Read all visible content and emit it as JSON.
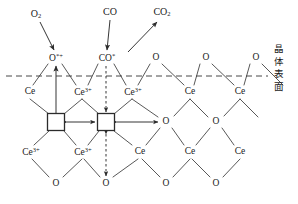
{
  "figure": {
    "kind": "reaction-mechanism-schematic",
    "surface_label": {
      "chars": [
        "晶",
        "体",
        "表",
        "面"
      ],
      "meaning": "crystal surface"
    },
    "colors": {
      "line": "#333333",
      "text": "#1a1a1a",
      "dashed": "#333333",
      "vacancy_fill": "#ffffff",
      "vacancy_stroke": "#333333"
    }
  },
  "gas_species": [
    {
      "id": "o2",
      "label_html": "O<sub>2</sub>",
      "text": "O2",
      "x": 36,
      "y": 14
    },
    {
      "id": "co",
      "label_html": "CO",
      "text": "CO",
      "x": 110,
      "y": 12
    },
    {
      "id": "co2",
      "label_html": "CO<sub>2</sub>",
      "text": "CO2",
      "x": 160,
      "y": 12
    }
  ],
  "adsorbate_row": [
    {
      "id": "o-star-plus",
      "label_html": "O<sup>*</sup><sup>+</sup>",
      "text": "O*+",
      "x": 55,
      "y": 58
    },
    {
      "id": "co-star",
      "label_html": "CO<sup>*</sup>",
      "text": "CO*",
      "x": 106,
      "y": 58
    },
    {
      "id": "o-top-1",
      "label_html": "O",
      "text": "O",
      "x": 156,
      "y": 58
    },
    {
      "id": "o-top-2",
      "label_html": "O",
      "text": "O",
      "x": 206,
      "y": 58
    },
    {
      "id": "o-top-3",
      "label_html": "O",
      "text": "O",
      "x": 256,
      "y": 58
    }
  ],
  "cation_row_upper": [
    {
      "id": "ce-u1",
      "label_html": "Ce",
      "text": "Ce",
      "x": 30,
      "y": 92
    },
    {
      "id": "ce-u2",
      "label_html": "Ce<sup>3+</sup>",
      "text": "Ce3+",
      "x": 82,
      "y": 92
    },
    {
      "id": "ce-u3",
      "label_html": "Ce<sup>3+</sup>",
      "text": "Ce3+",
      "x": 132,
      "y": 92
    },
    {
      "id": "ce-u4",
      "label_html": "Ce",
      "text": "Ce",
      "x": 190,
      "y": 92
    },
    {
      "id": "ce-u5",
      "label_html": "Ce",
      "text": "Ce",
      "x": 240,
      "y": 92
    }
  ],
  "vacancy_row": [
    {
      "id": "vacancy-1",
      "type": "square",
      "x": 56,
      "y": 122
    },
    {
      "id": "vacancy-2",
      "type": "square",
      "x": 106,
      "y": 122
    },
    {
      "id": "o-mid-1",
      "type": "label",
      "label_html": "O",
      "text": "O",
      "x": 166,
      "y": 122
    },
    {
      "id": "o-mid-2",
      "type": "label",
      "label_html": "O",
      "text": "O",
      "x": 216,
      "y": 122
    }
  ],
  "cation_row_lower": [
    {
      "id": "ce-l1",
      "label_html": "Ce<sup>3+</sup>",
      "text": "Ce3+",
      "x": 30,
      "y": 152
    },
    {
      "id": "ce-l2",
      "label_html": "Ce<sup>3+</sup>",
      "text": "Ce3+",
      "x": 82,
      "y": 152
    },
    {
      "id": "ce-l3",
      "label_html": "Ce",
      "text": "Ce",
      "x": 140,
      "y": 152
    },
    {
      "id": "ce-l4",
      "label_html": "Ce",
      "text": "Ce",
      "x": 190,
      "y": 152
    },
    {
      "id": "ce-l5",
      "label_html": "Ce",
      "text": "Ce",
      "x": 240,
      "y": 152
    }
  ],
  "anion_row_bottom": [
    {
      "id": "o-b1",
      "label_html": "O",
      "text": "O",
      "x": 56,
      "y": 184
    },
    {
      "id": "o-b2",
      "label_html": "O",
      "text": "O",
      "x": 106,
      "y": 184
    },
    {
      "id": "o-b3",
      "label_html": "O",
      "text": "O",
      "x": 166,
      "y": 184
    },
    {
      "id": "o-b4",
      "label_html": "O",
      "text": "O",
      "x": 216,
      "y": 184
    }
  ],
  "arrows": [
    {
      "id": "arrow-o2-adsorb",
      "from": "O2 gas",
      "to": "O*+ site",
      "style": "single"
    },
    {
      "id": "arrow-co-adsorb",
      "from": "CO gas",
      "to": "CO* site",
      "style": "single"
    },
    {
      "id": "arrow-co2-desorb",
      "from": "surface",
      "to": "CO2 gas",
      "style": "single"
    },
    {
      "id": "arrow-vac-to-o",
      "from": "vacancy-1",
      "to": "O*+ site",
      "style": "single-up"
    },
    {
      "id": "arrow-costar-down",
      "from": "CO* site",
      "to": "vacancy-2",
      "style": "single-down"
    },
    {
      "id": "arrow-vac1-vac2",
      "from": "vacancy-1",
      "to": "vacancy-2",
      "style": "double"
    },
    {
      "id": "arrow-vac2-omid",
      "from": "vacancy-2",
      "to": "o-mid-1",
      "style": "double"
    },
    {
      "id": "arrow-vac2-obottom",
      "from": "vacancy-2",
      "to": "o-b2",
      "style": "double-vertical"
    }
  ]
}
